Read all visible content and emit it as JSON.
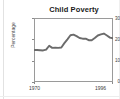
{
  "chart_data": {
    "type": "line",
    "title": "Child Poverty",
    "xlabel": "",
    "ylabel": "Percentage",
    "ylim": [
      0,
      30
    ],
    "xlim": [
      1970,
      1996
    ],
    "grid": false,
    "legend": "none",
    "line_color": "#6b6b6b",
    "y_ticks": [
      "30",
      "20",
      "10",
      "0"
    ],
    "y_tick_values": [
      30,
      20,
      10,
      0
    ],
    "x_ticks": [
      "1970",
      "1996"
    ],
    "x_tick_values": [
      1970,
      1996
    ],
    "x": [
      1970,
      1971,
      1972,
      1973,
      1974,
      1975,
      1976,
      1977,
      1978,
      1979,
      1980,
      1981,
      1982,
      1983,
      1984,
      1985,
      1986,
      1987,
      1988,
      1989,
      1990,
      1991,
      1992,
      1993,
      1994,
      1995,
      1996
    ],
    "values": [
      15.0,
      15.0,
      14.9,
      14.8,
      15.2,
      17.0,
      16.0,
      16.1,
      16.0,
      16.2,
      18.2,
      20.0,
      21.9,
      22.2,
      21.5,
      20.6,
      20.3,
      20.3,
      19.6,
      19.6,
      20.6,
      21.8,
      22.3,
      22.7,
      21.8,
      20.8,
      20.5
    ]
  },
  "figure": {
    "series_name": "child-poverty-rate"
  }
}
